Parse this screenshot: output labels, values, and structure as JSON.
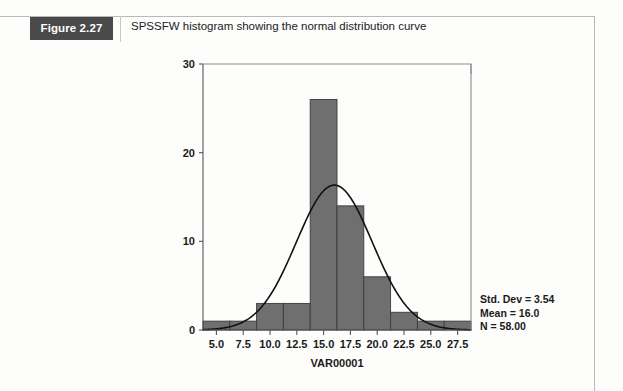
{
  "figure": {
    "badge_label": "Figure 2.27",
    "caption": "SPSSFW histogram showing the normal distribution curve"
  },
  "stats": {
    "std_dev": "Std. Dev = 3.54",
    "mean": "Mean = 16.0",
    "n": "N = 58.00"
  },
  "chart_data": {
    "type": "bar",
    "title": "SPSSFW histogram showing the normal distribution curve",
    "xlabel": "VAR00001",
    "ylabel": "",
    "xlim": [
      3.75,
      28.75
    ],
    "ylim": [
      0,
      30
    ],
    "grid": false,
    "legend": "none",
    "xticks": [
      "5.0",
      "7.5",
      "10.0",
      "12.5",
      "15.0",
      "17.5",
      "20.0",
      "22.5",
      "25.0",
      "27.5"
    ],
    "xtick_values": [
      5.0,
      7.5,
      10.0,
      12.5,
      15.0,
      17.5,
      20.0,
      22.5,
      25.0,
      27.5
    ],
    "yticks": [
      "0",
      "10",
      "20",
      "30"
    ],
    "ytick_values": [
      0,
      10,
      20,
      30
    ],
    "bin_width": 2.5,
    "bin_centers": [
      5.0,
      7.5,
      10.0,
      12.5,
      15.0,
      17.5,
      20.0,
      22.5,
      25.0,
      27.5
    ],
    "values": [
      1,
      1,
      3,
      3,
      26,
      14,
      6,
      2,
      1,
      1
    ],
    "bar_color": "#6f6f6f",
    "bar_edge_color": "#3b3b3b",
    "overlay": {
      "type": "normal-curve",
      "mean": 16.0,
      "std_dev": 3.54,
      "n": 58,
      "color": "#111111"
    },
    "annotations": [
      "Std. Dev = 3.54",
      "Mean = 16.0",
      "N = 58.00"
    ]
  },
  "colors": {
    "badge_bg": "#4a4a4a",
    "badge_text": "#ffffff",
    "frame": "#b9b9b9",
    "axis": "#555555"
  }
}
